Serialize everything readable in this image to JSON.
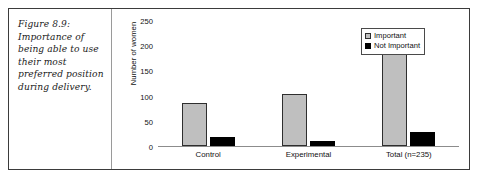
{
  "figure": {
    "caption": "Figure 8.9: Importance of being able to use their most preferred position during delivery."
  },
  "chart_data": {
    "type": "bar",
    "title": "",
    "xlabel": "",
    "ylabel": "Number of women",
    "ylim": [
      0,
      250
    ],
    "yticks": [
      0,
      50,
      100,
      150,
      200,
      250
    ],
    "grid": false,
    "legend_position": "top-right",
    "categories": [
      "Control",
      "Experimental",
      "Total (n=235)"
    ],
    "series": [
      {
        "name": "Important",
        "color": "#bfbfbf",
        "values": [
          85,
          103,
          195
        ]
      },
      {
        "name": "Not Important",
        "color": "#000000",
        "values": [
          17,
          10,
          28
        ]
      }
    ]
  }
}
